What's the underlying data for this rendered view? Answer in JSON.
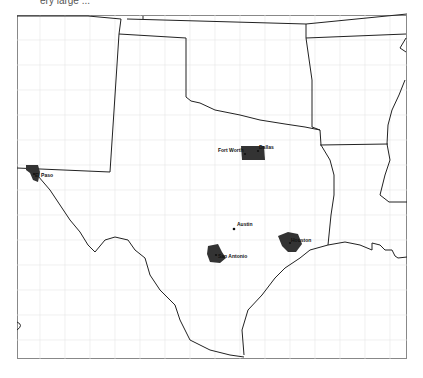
{
  "caption": "ery large ... ",
  "map": {
    "region": "Texas and surrounding states",
    "colors": {
      "state_border": "#222222",
      "county_border": "#e4e4e4",
      "metro_fill": "#333333",
      "background": "#ffffff"
    },
    "cities": [
      {
        "name": "El Paso",
        "x": 38,
        "y": 174
      },
      {
        "name": "Fort Worth",
        "x": 244,
        "y": 152
      },
      {
        "name": "Dallas",
        "x": 257,
        "y": 150
      },
      {
        "name": "Austin",
        "x": 234,
        "y": 227
      },
      {
        "name": "San Antonio",
        "x": 216,
        "y": 256
      },
      {
        "name": "Houston",
        "x": 291,
        "y": 242
      }
    ]
  }
}
